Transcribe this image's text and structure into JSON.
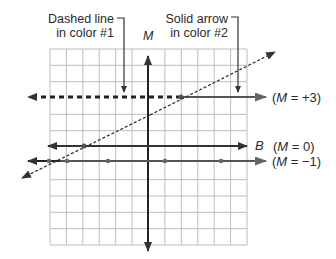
{
  "callouts": {
    "dashed": {
      "line1": "Dashed line",
      "line2": "in color #1"
    },
    "solid": {
      "line1": "Solid arrow",
      "line2": "in color #2"
    }
  },
  "axis": {
    "vertical_label": "M"
  },
  "lines": {
    "m_plus_3": {
      "label_pre": "(",
      "var": "M",
      "label_post": " = +3)"
    },
    "b_line": {
      "name": "B",
      "label_pre": "(",
      "var": "M",
      "label_post": " = 0)"
    },
    "m_minus_1": {
      "label_pre": "(",
      "var": "M",
      "label_post": " = −1)"
    }
  },
  "grid": {
    "columns": 12,
    "rows": 12
  },
  "colors": {
    "line": "#3a3a3a",
    "grid": "#b8b8b8",
    "solid": "#555555"
  }
}
